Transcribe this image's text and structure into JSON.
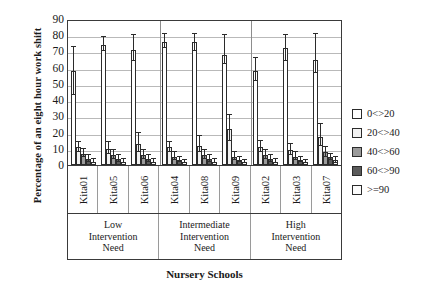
{
  "chart_data": {
    "type": "bar",
    "title": "",
    "xlabel": "Nursery Schools",
    "ylabel": "Percentage of an eight hour work shift",
    "ylim": [
      0,
      90
    ],
    "yticks": [
      90,
      80,
      70,
      60,
      50,
      40,
      30,
      20,
      10,
      0
    ],
    "grid": true,
    "legend_position": "right",
    "legend_title": "",
    "categories": [
      "Kita01",
      "Kita05",
      "Kita06",
      "Kita04",
      "Kita08",
      "Kita09",
      "Kita02",
      "Kita03",
      "Kita07"
    ],
    "groups": [
      {
        "label": "Low Intervention Need",
        "categories": [
          "Kita01",
          "Kita05",
          "Kita06"
        ]
      },
      {
        "label": "Intermediate Intervention Need",
        "categories": [
          "Kita04",
          "Kita08",
          "Kita09"
        ]
      },
      {
        "label": "High Intervention Need",
        "categories": [
          "Kita02",
          "Kita03",
          "Kita07"
        ]
      }
    ],
    "series": [
      {
        "name": "0<>20",
        "values": [
          58,
          74,
          71,
          76,
          76,
          68,
          58,
          72,
          65
        ],
        "err_low": [
          43,
          70,
          64,
          72,
          70,
          62,
          52,
          64,
          57
        ],
        "err_high": [
          73,
          79,
          80,
          81,
          81,
          80,
          66,
          80,
          81
        ]
      },
      {
        "name": "20<>40",
        "values": [
          11,
          10,
          13,
          11,
          12,
          22,
          11,
          9,
          17
        ],
        "err_low": [
          8,
          7,
          8,
          8,
          8,
          15,
          8,
          6,
          12
        ],
        "err_high": [
          14,
          14,
          20,
          14,
          18,
          31,
          15,
          13,
          25
        ]
      },
      {
        "name": "40<>60",
        "values": [
          7,
          6,
          6,
          5,
          6,
          5,
          6,
          5,
          8
        ],
        "err_low": [
          5,
          4,
          4,
          3,
          4,
          3,
          4,
          3,
          5
        ],
        "err_high": [
          10,
          9,
          9,
          8,
          9,
          8,
          9,
          8,
          11
        ]
      },
      {
        "name": "60<>90",
        "values": [
          4,
          4,
          4,
          3,
          4,
          3,
          4,
          3,
          5
        ],
        "err_low": [
          2,
          2,
          2,
          2,
          2,
          2,
          2,
          2,
          3
        ],
        "err_high": [
          6,
          6,
          6,
          5,
          6,
          5,
          6,
          5,
          7
        ]
      },
      {
        "name": ">=90",
        "values": [
          2,
          2,
          2,
          2,
          2,
          2,
          2,
          2,
          3
        ],
        "err_low": [
          1,
          1,
          1,
          1,
          1,
          1,
          1,
          1,
          1
        ],
        "err_high": [
          4,
          4,
          4,
          3,
          4,
          3,
          4,
          3,
          5
        ]
      }
    ]
  }
}
